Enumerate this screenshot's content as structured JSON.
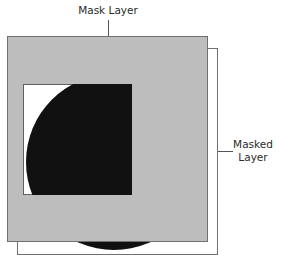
{
  "diagram": {
    "labels": {
      "mask_layer": "Mask Layer",
      "masked_layer_line1": "Masked",
      "masked_layer_line2": "Layer"
    },
    "colors": {
      "mask_fill": "#bdbdbd",
      "mask_stroke": "#707070",
      "masked_layer_fill": "#ffffff",
      "masked_layer_stroke": "#707070",
      "window_fill": "#ffffff",
      "circle_fill": "#111111",
      "leader_line": "#555555"
    }
  }
}
